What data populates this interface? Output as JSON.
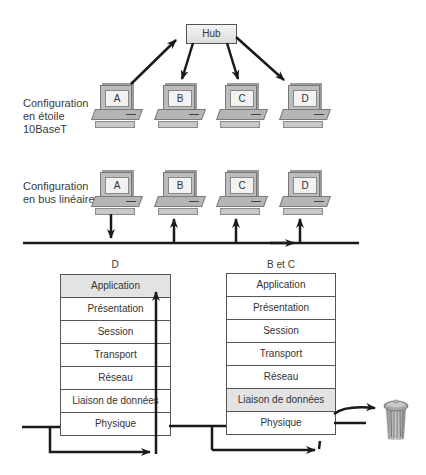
{
  "star": {
    "label_lines": [
      "Configuration",
      "en étoile",
      "10BaseT"
    ],
    "hub_label": "Hub",
    "computers": [
      "A",
      "B",
      "C",
      "D"
    ]
  },
  "bus": {
    "label_lines": [
      "Configuration",
      "en bus linéaire"
    ],
    "computers": [
      "A",
      "B",
      "C",
      "D"
    ]
  },
  "stacks": [
    {
      "title": "D",
      "layers": [
        "Application",
        "Présentation",
        "Session",
        "Transport",
        "Réseau",
        "Liaison de données",
        "Physique"
      ],
      "highlighted_layer": "Application"
    },
    {
      "title": "B et C",
      "layers": [
        "Application",
        "Présentation",
        "Session",
        "Transport",
        "Réseau",
        "Liaison de données",
        "Physique"
      ],
      "highlighted_layer": "Liaison de données"
    }
  ],
  "icons": {
    "discard": "trash-can-icon"
  },
  "colors": {
    "line": "#1a1a1a",
    "highlight": "#e3e3e3",
    "device": "#bdbdbd"
  }
}
